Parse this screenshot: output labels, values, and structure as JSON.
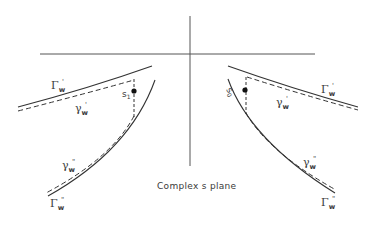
{
  "diagram": {
    "caption": "Complex s plane",
    "labels": {
      "left_upper_Gamma": {
        "base": "Γ",
        "sub": "w",
        "sup": "'"
      },
      "left_upper_gamma": {
        "base": "γ",
        "sub": "w",
        "sup": "'"
      },
      "left_lower_gamma": {
        "base": "γ",
        "sub": "w",
        "sup": "\""
      },
      "left_lower_Gamma": {
        "base": "Γ",
        "sub": "w",
        "sup": "\""
      },
      "right_upper_Gamma": {
        "base": "Γ",
        "sub": "w",
        "sup": "'"
      },
      "right_upper_gamma": {
        "base": "γ",
        "sub": "w",
        "sup": "'"
      },
      "right_lower_gamma": {
        "base": "γ",
        "sub": "w",
        "sup": "\""
      },
      "right_lower_Gamma": {
        "base": "Γ",
        "sub": "w",
        "sup": "\""
      },
      "point_left": {
        "base": "s",
        "sub": "1"
      },
      "point_right": {
        "base": "s",
        "sub": "0"
      }
    },
    "colors": {
      "ink": "#3a3a3a",
      "background": "#ffffff"
    }
  }
}
